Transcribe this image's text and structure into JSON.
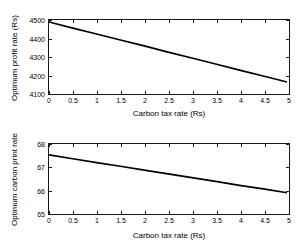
{
  "figure": {
    "background": "#ffffff",
    "line_color": "#000000"
  },
  "chart_data": [
    {
      "type": "line",
      "title": "",
      "panel": "top",
      "xlabel": "Carbon tax rate (Rs)",
      "ylabel": "Optimum profit rate (Rs)",
      "xlim": [
        0,
        5
      ],
      "ylim": [
        4100,
        4500
      ],
      "xticks": [
        0,
        0.5,
        1,
        1.5,
        2,
        2.5,
        3,
        3.5,
        4,
        4.5,
        5
      ],
      "xticklabels": [
        "0",
        "0.5",
        "1",
        "1.5",
        "2",
        "2.5",
        "3",
        "3.5",
        "4",
        "4.5",
        "5"
      ],
      "yticks": [
        4100,
        4200,
        4300,
        4400,
        4500
      ],
      "yticklabels": [
        "4100",
        "4200",
        "4300",
        "4400",
        "4500"
      ],
      "grid": false,
      "legend": null,
      "series": [
        {
          "name": "Optimum profit rate",
          "x": [
            0,
            0.5,
            1,
            1.5,
            2,
            2.5,
            3,
            3.5,
            4,
            4.5,
            5
          ],
          "values": [
            4489,
            4455,
            4422,
            4389,
            4356,
            4322,
            4289,
            4256,
            4222,
            4189,
            4156
          ]
        }
      ]
    },
    {
      "type": "line",
      "title": "",
      "panel": "bottom",
      "xlabel": "Carbon tax rate (Rs)",
      "ylabel": "Optimum carbon print rate",
      "xlim": [
        0,
        5
      ],
      "ylim": [
        65,
        68
      ],
      "xticks": [
        0,
        0.5,
        1,
        1.5,
        2,
        2.5,
        3,
        3.5,
        4,
        4.5,
        5
      ],
      "xticklabels": [
        "0",
        "0.5",
        "1",
        "1.5",
        "2",
        "2.5",
        "3",
        "3.5",
        "4",
        "4.5",
        "5"
      ],
      "yticks": [
        65,
        66,
        67,
        68
      ],
      "yticklabels": [
        "65",
        "66",
        "67",
        "68"
      ],
      "grid": false,
      "legend": null,
      "series": [
        {
          "name": "Optimum carbon print rate",
          "x": [
            0,
            0.5,
            1,
            1.5,
            2,
            2.5,
            3,
            3.5,
            4,
            4.5,
            5
          ],
          "values": [
            67.52,
            67.35,
            67.18,
            67.02,
            66.85,
            66.68,
            66.52,
            66.35,
            66.18,
            66.02,
            65.85
          ]
        }
      ]
    }
  ]
}
